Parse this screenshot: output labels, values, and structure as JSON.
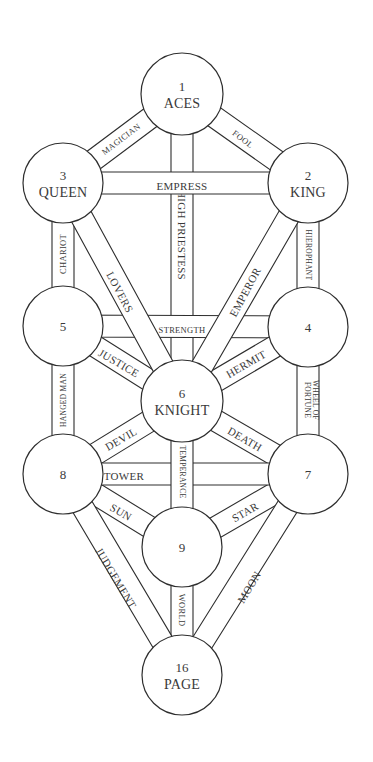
{
  "colors": {
    "stroke": "#2e2e2e",
    "text": "#3a3a3a",
    "background": "#ffffff"
  },
  "band_width": 22,
  "nodes": [
    {
      "id": "1",
      "number": "1",
      "name": "ACES",
      "cx": 182,
      "cy": 94,
      "r": 41
    },
    {
      "id": "2",
      "number": "2",
      "name": "KING",
      "cx": 308,
      "cy": 183,
      "r": 40
    },
    {
      "id": "3",
      "number": "3",
      "name": "QUEEN",
      "cx": 63,
      "cy": 183,
      "r": 40
    },
    {
      "id": "4",
      "number": "4",
      "name": "",
      "cx": 308,
      "cy": 327,
      "r": 40
    },
    {
      "id": "5",
      "number": "5",
      "name": "",
      "cx": 63,
      "cy": 326,
      "r": 40
    },
    {
      "id": "6",
      "number": "6",
      "name": "KNIGHT",
      "cx": 182,
      "cy": 401,
      "r": 41
    },
    {
      "id": "7",
      "number": "7",
      "name": "",
      "cx": 308,
      "cy": 474,
      "r": 40
    },
    {
      "id": "8",
      "number": "8",
      "name": "",
      "cx": 63,
      "cy": 474,
      "r": 40
    },
    {
      "id": "9",
      "number": "9",
      "name": "",
      "cx": 182,
      "cy": 547,
      "r": 40
    },
    {
      "id": "16",
      "number": "16",
      "name": "PAGE",
      "cx": 182,
      "cy": 675,
      "r": 40
    }
  ],
  "paths": [
    {
      "label": "HIGH PRIESTESS",
      "from": "1",
      "to": "6",
      "lx": 182,
      "ly": 235,
      "rot": 90,
      "size": "normal",
      "layer": 0
    },
    {
      "label": "TEMPERANCE",
      "from": "6",
      "to": "9",
      "lx": 182,
      "ly": 472,
      "rot": 90,
      "size": "tiny",
      "layer": 2
    },
    {
      "label": "WORLD",
      "from": "9",
      "to": "16",
      "lx": 182,
      "ly": 610,
      "rot": 90,
      "size": "small",
      "layer": 0
    },
    {
      "label": "EMPRESS",
      "from": "3",
      "to": "2",
      "lx": 182,
      "ly": 186,
      "rot": 0,
      "size": "normal",
      "layer": 1
    },
    {
      "label": "STRENGTH",
      "from": "5",
      "to": "4",
      "lx": 182,
      "ly": 330,
      "rot": 0,
      "size": "small",
      "layer": 0
    },
    {
      "label": "TOWER",
      "from": "8",
      "to": "7",
      "lx": 124,
      "ly": 476,
      "rot": 0,
      "size": "normal",
      "layer": 1
    },
    {
      "label": "MAGICIAN",
      "from": "1",
      "to": "3",
      "lx": 121,
      "ly": 139,
      "rot": -37,
      "size": "small",
      "layer": 0
    },
    {
      "label": "FOOL",
      "from": "1",
      "to": "2",
      "lx": 243,
      "ly": 139,
      "rot": 37,
      "size": "small",
      "layer": 0
    },
    {
      "label": "CHARIOT",
      "from": "3",
      "to": "5",
      "lx": 63,
      "ly": 254,
      "rot": -90,
      "size": "small",
      "layer": 0
    },
    {
      "label": "HIEROPHANT",
      "from": "2",
      "to": "4",
      "lx": 308,
      "ly": 255,
      "rot": 90,
      "size": "tiny",
      "layer": 0
    },
    {
      "label": "LOVERS",
      "from": "3",
      "to": "6",
      "lx": 120,
      "ly": 292,
      "rot": 62,
      "size": "normal",
      "layer": 1
    },
    {
      "label": "EMPEROR",
      "from": "2",
      "to": "6",
      "lx": 245,
      "ly": 292,
      "rot": -62,
      "size": "normal",
      "layer": 1
    },
    {
      "label": "JUSTICE",
      "from": "5",
      "to": "6",
      "lx": 119,
      "ly": 363,
      "rot": 30,
      "size": "normal",
      "layer": 0
    },
    {
      "label": "HERMIT",
      "from": "4",
      "to": "6",
      "lx": 246,
      "ly": 364,
      "rot": -30,
      "size": "normal",
      "layer": 0
    },
    {
      "label": "HANGED MAN",
      "from": "5",
      "to": "8",
      "lx": 63,
      "ly": 400,
      "rot": -90,
      "size": "tiny",
      "layer": 0
    },
    {
      "label": "WHEEL OF",
      "from": "4",
      "to": "7",
      "lx": 312,
      "ly": 400,
      "rot": 90,
      "size": "tiny",
      "layer": 0,
      "line2": "FORTUNE"
    },
    {
      "label": "DEVIL",
      "from": "8",
      "to": "6",
      "lx": 121,
      "ly": 439,
      "rot": -30,
      "size": "normal",
      "layer": 0
    },
    {
      "label": "DEATH",
      "from": "6",
      "to": "7",
      "lx": 245,
      "ly": 439,
      "rot": 30,
      "size": "normal",
      "layer": 0
    },
    {
      "label": "SUN",
      "from": "8",
      "to": "9",
      "lx": 121,
      "ly": 512,
      "rot": 30,
      "size": "normal",
      "layer": 0
    },
    {
      "label": "STAR",
      "from": "7",
      "to": "9",
      "lx": 245,
      "ly": 512,
      "rot": -30,
      "size": "normal",
      "layer": 0
    },
    {
      "label": "JUDGEMENT",
      "from": "8",
      "to": "16",
      "lx": 116,
      "ly": 578,
      "rot": 59,
      "size": "normal",
      "layer": 0
    },
    {
      "label": "MOON",
      "from": "7",
      "to": "16",
      "lx": 249,
      "ly": 587,
      "rot": -59,
      "size": "normal",
      "layer": 0
    }
  ]
}
